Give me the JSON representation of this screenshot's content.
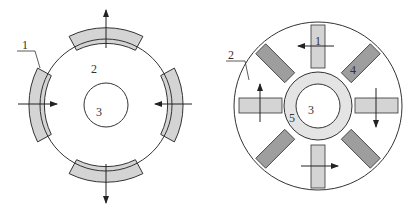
{
  "colors": {
    "stroke": "#333333",
    "fill_gray": "#d4d4d4",
    "fill_dark": "#9e9e9e",
    "fill_ring": "#e4e4e4",
    "background": "#ffffff"
  },
  "left_figure": {
    "labels": {
      "magnet": "1",
      "rotor": "2",
      "shaft": "3"
    },
    "magnet_count": 4,
    "arrow_directions": [
      "up",
      "right",
      "down",
      "left"
    ]
  },
  "right_figure": {
    "labels": {
      "magnet": "1",
      "rotor": "2",
      "shaft": "3",
      "pole_piece": "4",
      "sleeve": "5"
    },
    "radial_magnet_count": 4,
    "diagonal_piece_count": 4,
    "arrow_directions": [
      "left",
      "down",
      "right",
      "up"
    ]
  }
}
